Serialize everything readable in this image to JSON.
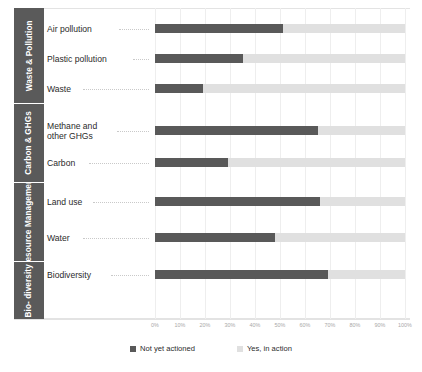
{
  "chart_data": {
    "type": "bar",
    "orientation": "horizontal",
    "stacked": true,
    "normalized_percent": true,
    "title": "",
    "subtitle": "",
    "xlabel": "",
    "ylabel": "",
    "xlim": [
      0,
      100
    ],
    "grid": true,
    "legend_position": "bottom",
    "tick_labels": [
      "0%",
      "10%",
      "20%",
      "30%",
      "40%",
      "50%",
      "60%",
      "70%",
      "80%",
      "90%",
      "100%"
    ],
    "tick_values": [
      0,
      10,
      20,
      30,
      40,
      50,
      60,
      70,
      80,
      90,
      100
    ],
    "categories": [
      "Air pollution",
      "Plastic pollution",
      "Waste",
      "Methane and\nother GHGs",
      "Carbon",
      "Land use",
      "Water",
      "Biodiversity"
    ],
    "series": [
      {
        "name": "Not yet actioned",
        "color": "#595959",
        "values": [
          51,
          35,
          19,
          65,
          29,
          66,
          48,
          69
        ]
      },
      {
        "name": "Yes, in action",
        "color": "#e0e0e0",
        "values": [
          49,
          65,
          81,
          35,
          71,
          34,
          52,
          31
        ]
      }
    ],
    "groups": [
      {
        "label": "Waste\n& Pollution",
        "categories": [
          "Air pollution",
          "Plastic pollution",
          "Waste"
        ]
      },
      {
        "label": "Carbon\n& GHGs",
        "categories": [
          "Methane and\nother GHGs",
          "Carbon"
        ]
      },
      {
        "label": "Resource\nManagement",
        "categories": [
          "Land use",
          "Water"
        ]
      },
      {
        "label": "Bio-\ndiversity",
        "categories": [
          "Biodiversity"
        ]
      }
    ]
  },
  "legend": {
    "items": [
      {
        "label": "Not yet actioned",
        "color": "#595959"
      },
      {
        "label": "Yes, in action",
        "color": "#e0e0e0"
      }
    ]
  },
  "groups": [
    {
      "label": "Waste\n& Pollution"
    },
    {
      "label": "Carbon\n& GHGs"
    },
    {
      "label": "Resource\nManagement"
    },
    {
      "label": "Bio-\ndiversity"
    }
  ],
  "rows": [
    {
      "label": "Air pollution",
      "dark": 51,
      "light": 49
    },
    {
      "label": "Plastic pollution",
      "dark": 35,
      "light": 65
    },
    {
      "label": "Waste",
      "dark": 19,
      "light": 81
    },
    {
      "label": "Methane and\nother GHGs",
      "dark": 65,
      "light": 35
    },
    {
      "label": "Carbon",
      "dark": 29,
      "light": 71
    },
    {
      "label": "Land use",
      "dark": 66,
      "light": 34
    },
    {
      "label": "Water",
      "dark": 48,
      "light": 52
    },
    {
      "label": "Biodiversity",
      "dark": 69,
      "light": 31
    }
  ],
  "axis": {
    "ticks": [
      "0%",
      "10%",
      "20%",
      "30%",
      "40%",
      "50%",
      "60%",
      "70%",
      "80%",
      "90%",
      "100%"
    ]
  },
  "colors": {
    "dark": "#595959",
    "light": "#e0e0e0",
    "group_band": "#5a5a5a",
    "grid": "#eeeeee",
    "text": "#2b2b2b",
    "tick_text": "#a8a8a8"
  }
}
